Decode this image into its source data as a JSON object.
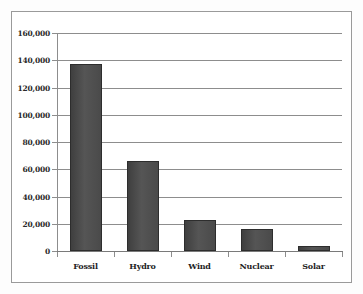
{
  "chart_data": {
    "type": "bar",
    "title": "",
    "subtitle": "",
    "xlabel": "",
    "ylabel": "",
    "categories": [
      "Fossil",
      "Hydro",
      "Wind",
      "Nuclear",
      "Solar"
    ],
    "values": [
      137000,
      66000,
      22500,
      16500,
      3500
    ],
    "ylim": [
      0,
      160000
    ],
    "ytick_values": [
      0,
      20000,
      40000,
      60000,
      80000,
      100000,
      120000,
      140000,
      160000
    ],
    "ytick_labels": [
      "0",
      "20,000",
      "40,000",
      "60,000",
      "80,000",
      "100,000",
      "120,000",
      "140,000",
      "160,000"
    ],
    "grid": true,
    "grid_axis": "y",
    "legend": false,
    "legend_position": "none",
    "bar_color": "#4a4a4a",
    "bar_edge_color": "#2d2d2d",
    "gridline_color": "#8d8d8d",
    "axis_color": "#7a7a7a",
    "frame_color": "#9a9a9a",
    "background_color": "#ffffff"
  }
}
